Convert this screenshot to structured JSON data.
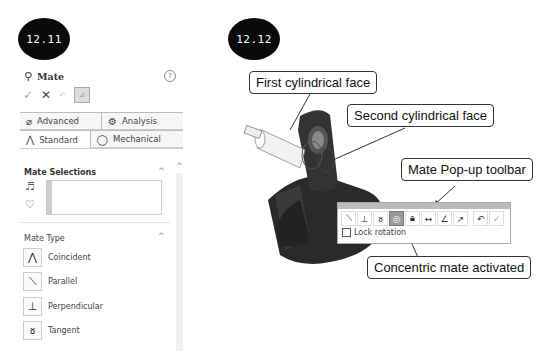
{
  "badges": {
    "left": "12.11",
    "right": "12.12"
  },
  "panel": {
    "title": "Mate",
    "help_icon": "help-icon",
    "actions": {
      "ok": "✓",
      "cancel": "✕",
      "undo": "↶",
      "pin": "📌"
    },
    "tabs_row1": [
      {
        "label": "Advanced",
        "icon": "advanced-mate-icon"
      },
      {
        "label": "Analysis",
        "icon": "analysis-icon"
      }
    ],
    "tabs_row2": [
      {
        "label": "Standard",
        "icon": "standard-mate-icon",
        "active": true
      },
      {
        "label": "Mechanical",
        "icon": "mechanical-mate-icon",
        "active": false
      }
    ],
    "mate_selections": {
      "title": "Mate Selections"
    },
    "mate_type": {
      "title": "Mate Type",
      "items": [
        {
          "label": "Coincident",
          "icon": "coincident-icon"
        },
        {
          "label": "Parallel",
          "icon": "parallel-icon"
        },
        {
          "label": "Perpendicular",
          "icon": "perpendicular-icon"
        },
        {
          "label": "Tangent",
          "icon": "tangent-icon"
        }
      ]
    }
  },
  "callouts": {
    "first": "First cylindrical face",
    "second": "Second cylindrical face",
    "toolbar": "Mate Pop-up toolbar",
    "concentric": "Concentric mate activated"
  },
  "popup": {
    "icons": [
      "parallel",
      "perpendicular",
      "tangent",
      "concentric",
      "lock",
      "distance",
      "angle",
      "flip",
      "undo",
      "ok"
    ],
    "active": "concentric",
    "lock_rotation": "Lock rotation"
  }
}
